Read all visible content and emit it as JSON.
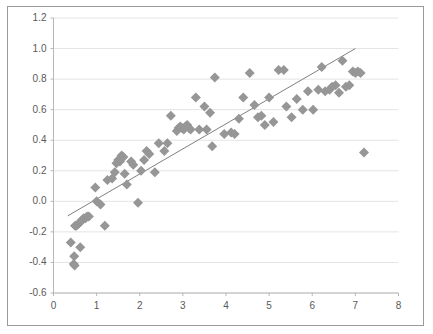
{
  "chart_data": {
    "type": "scatter",
    "title": "",
    "subtitle": "",
    "xlabel": "",
    "ylabel": "",
    "xlim": [
      0,
      8
    ],
    "ylim": [
      -0.6,
      1.2
    ],
    "xticks": [
      "0",
      "1",
      "2",
      "3",
      "4",
      "5",
      "6",
      "7",
      "8"
    ],
    "xtick_values": [
      0,
      1,
      2,
      3,
      4,
      5,
      6,
      7,
      8
    ],
    "yticks": [
      "-0.6",
      "-0.4",
      "-0.2",
      "0.0",
      "0.2",
      "0.4",
      "0.6",
      "0.8",
      "1.0",
      "1.2"
    ],
    "ytick_values": [
      -0.6,
      -0.4,
      -0.2,
      0.0,
      0.2,
      0.4,
      0.6,
      0.8,
      1.0,
      1.2
    ],
    "grid": "horizontal",
    "legend": "none",
    "marker": "diamond",
    "marker_color": "#969696",
    "marker_size": 5,
    "series": [
      {
        "name": "observations",
        "points": [
          [
            0.4,
            -0.27
          ],
          [
            0.47,
            -0.41
          ],
          [
            0.48,
            -0.36
          ],
          [
            0.49,
            -0.42
          ],
          [
            0.5,
            -0.16
          ],
          [
            0.53,
            -0.16
          ],
          [
            0.57,
            -0.15
          ],
          [
            0.6,
            -0.14
          ],
          [
            0.62,
            -0.3
          ],
          [
            0.64,
            -0.13
          ],
          [
            0.67,
            -0.12
          ],
          [
            0.7,
            -0.11
          ],
          [
            0.74,
            -0.11
          ],
          [
            0.78,
            -0.1
          ],
          [
            0.82,
            -0.1
          ],
          [
            0.97,
            0.09
          ],
          [
            1.0,
            0.0
          ],
          [
            1.09,
            -0.02
          ],
          [
            1.19,
            -0.16
          ],
          [
            1.25,
            0.14
          ],
          [
            1.36,
            0.15
          ],
          [
            1.42,
            0.19
          ],
          [
            1.46,
            0.25
          ],
          [
            1.5,
            0.27
          ],
          [
            1.54,
            0.26
          ],
          [
            1.58,
            0.3
          ],
          [
            1.62,
            0.29
          ],
          [
            1.65,
            0.18
          ],
          [
            1.7,
            0.11
          ],
          [
            1.8,
            0.26
          ],
          [
            1.85,
            0.24
          ],
          [
            1.96,
            -0.01
          ],
          [
            2.03,
            0.2
          ],
          [
            2.1,
            0.27
          ],
          [
            2.16,
            0.33
          ],
          [
            2.22,
            0.31
          ],
          [
            2.35,
            0.19
          ],
          [
            2.44,
            0.38
          ],
          [
            2.57,
            0.33
          ],
          [
            2.64,
            0.38
          ],
          [
            2.72,
            0.56
          ],
          [
            2.86,
            0.46
          ],
          [
            2.9,
            0.48
          ],
          [
            2.94,
            0.49
          ],
          [
            2.98,
            0.48
          ],
          [
            3.02,
            0.47
          ],
          [
            3.06,
            0.49
          ],
          [
            3.1,
            0.5
          ],
          [
            3.14,
            0.48
          ],
          [
            3.18,
            0.47
          ],
          [
            3.3,
            0.68
          ],
          [
            3.38,
            0.47
          ],
          [
            3.5,
            0.62
          ],
          [
            3.55,
            0.47
          ],
          [
            3.63,
            0.58
          ],
          [
            3.68,
            0.36
          ],
          [
            3.74,
            0.81
          ],
          [
            3.96,
            0.44
          ],
          [
            4.12,
            0.45
          ],
          [
            4.2,
            0.44
          ],
          [
            4.3,
            0.54
          ],
          [
            4.4,
            0.68
          ],
          [
            4.55,
            0.84
          ],
          [
            4.66,
            0.63
          ],
          [
            4.74,
            0.55
          ],
          [
            4.82,
            0.56
          ],
          [
            4.9,
            0.5
          ],
          [
            5.0,
            0.68
          ],
          [
            5.1,
            0.52
          ],
          [
            5.22,
            0.86
          ],
          [
            5.34,
            0.86
          ],
          [
            5.4,
            0.62
          ],
          [
            5.52,
            0.55
          ],
          [
            5.64,
            0.67
          ],
          [
            5.78,
            0.6
          ],
          [
            5.9,
            0.72
          ],
          [
            6.02,
            0.6
          ],
          [
            6.14,
            0.73
          ],
          [
            6.22,
            0.88
          ],
          [
            6.3,
            0.72
          ],
          [
            6.4,
            0.73
          ],
          [
            6.46,
            0.75
          ],
          [
            6.54,
            0.76
          ],
          [
            6.62,
            0.71
          ],
          [
            6.7,
            0.92
          ],
          [
            6.78,
            0.75
          ],
          [
            6.86,
            0.76
          ],
          [
            6.94,
            0.85
          ],
          [
            7.0,
            0.84
          ],
          [
            7.06,
            0.85
          ],
          [
            7.12,
            0.84
          ],
          [
            7.2,
            0.32
          ]
        ]
      }
    ],
    "trendline": {
      "name": "linear-fit",
      "color": "#808080",
      "x_start": 0.33,
      "y_start": -0.095,
      "x_end": 7.0,
      "y_end": 1.0
    }
  }
}
